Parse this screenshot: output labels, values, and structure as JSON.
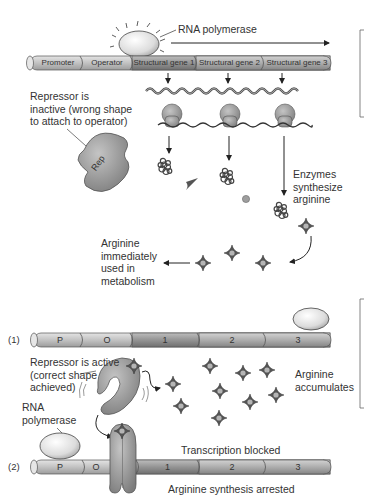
{
  "top_operon": {
    "rna_polymerase_label": "RNA polymerase",
    "segments": [
      "Promoter",
      "Operator",
      "Structural gene 1",
      "Structural gene 2",
      "Structural gene 3"
    ],
    "repressor_label": "Repressor is inactive (wrong shape to attach to operator)",
    "repressor_lines": [
      "Repressor is",
      "inactive (wrong shape",
      "to attach to operator)"
    ],
    "repressor_tag": "Rep",
    "enzymes_label_lines": [
      "Enzymes",
      "synthesize",
      "arginine"
    ],
    "arginine_used_lines": [
      "Arginine",
      "immediately",
      "used in",
      "metabolism"
    ]
  },
  "bottom_operon": {
    "row1": {
      "index_label": "(1)",
      "segments": [
        "P",
        "O",
        "1",
        "2",
        "3"
      ]
    },
    "repressor_active_lines": [
      "Repressor is active",
      "(correct shape",
      "achieved)"
    ],
    "arginine_accumulates_lines": [
      "Arginine",
      "accumulates"
    ],
    "rna_polymerase_lines": [
      "RNA",
      "polymerase"
    ],
    "transcription_blocked": "Transcription blocked",
    "row2": {
      "index_label": "(2)",
      "segments": [
        "P",
        "O",
        "1",
        "2",
        "3"
      ]
    },
    "arginine_synthesis_arrested": "Arginine synthesis arrested"
  },
  "colors": {
    "dna_light": "#c9c9c9",
    "dna_dark": "#8e8e8e",
    "protein_gray": "#9a9a9a",
    "arginine_center": "#b0b0b0",
    "line": "#222222"
  }
}
